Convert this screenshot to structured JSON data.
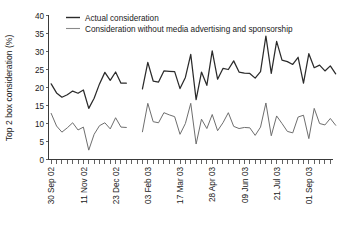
{
  "chart_data": {
    "type": "line",
    "title": "",
    "xlabel": "",
    "ylabel": "Top 2 box consideration (%)",
    "ylim": [
      0,
      40
    ],
    "yticks": [
      0,
      5,
      10,
      15,
      20,
      25,
      30,
      35,
      40
    ],
    "ytick_labels": [
      "0",
      "5",
      "10",
      "15",
      "20",
      "25",
      "30",
      "35",
      "40"
    ],
    "grid": false,
    "legend_position": "top-center",
    "xtick_labels": [
      "30 Sep 02",
      "11 Nov 02",
      "23 Dec 02",
      "03 Feb 03",
      "17 Mar 03",
      "28 Apr 03",
      "09 Jun 03",
      "21 Jul 03",
      "01 Sep 03"
    ],
    "xtick_indices": [
      0,
      6,
      12,
      18,
      24,
      30,
      36,
      42,
      48
    ],
    "n_minor_ticks": 53,
    "gap_note": "Data break between 23 Dec 02 and early Jan 03 (no observations collected)",
    "series": [
      {
        "name": "Actual consideration",
        "color": "#2b2b2b",
        "segments": [
          {
            "x": [
              0,
              1,
              2,
              3,
              4,
              5,
              6,
              7,
              8,
              9,
              10,
              11,
              12,
              13,
              14
            ],
            "values": [
              21.0,
              18.5,
              17.3,
              18.0,
              19.0,
              18.4,
              19.3,
              14.2,
              17.0,
              21.0,
              24.2,
              22.0,
              24.3,
              21.2,
              21.2
            ]
          },
          {
            "x": [
              17,
              18,
              19,
              20,
              21,
              22,
              23,
              24,
              25,
              26,
              27,
              28,
              29,
              30,
              31,
              32,
              33,
              34,
              35,
              36,
              37,
              38,
              39,
              40,
              41,
              42,
              43,
              44,
              45,
              46,
              47,
              48,
              49,
              50,
              51,
              52,
              53
            ],
            "values": [
              19.6,
              27.0,
              21.8,
              21.5,
              24.6,
              24.5,
              24.4,
              19.7,
              22.8,
              29.2,
              16.6,
              24.3,
              20.6,
              30.2,
              22.3,
              25.3,
              25.0,
              27.4,
              24.3,
              24.0,
              23.9,
              22.6,
              24.4,
              34.3,
              23.9,
              32.8,
              27.6,
              27.2,
              26.4,
              28.4,
              21.2,
              29.4,
              25.5,
              26.2,
              24.6,
              26.0,
              23.8
            ]
          }
        ]
      },
      {
        "name": "Consideration without media advertising and sponsorship",
        "color": "#6e6e6e",
        "segments": [
          {
            "x": [
              0,
              1,
              2,
              3,
              4,
              5,
              6,
              7,
              8,
              9,
              10,
              11,
              12,
              13,
              14
            ],
            "values": [
              12.8,
              9.3,
              7.6,
              8.8,
              10.2,
              8.2,
              9.0,
              2.6,
              7.0,
              9.4,
              10.2,
              8.5,
              11.6,
              9.0,
              8.9
            ]
          },
          {
            "x": [
              17,
              18,
              19,
              20,
              21,
              22,
              23,
              24,
              25,
              26,
              27,
              28,
              29,
              30,
              31,
              32,
              33,
              34,
              35,
              36,
              37,
              38,
              39,
              40,
              41,
              42,
              43,
              44,
              45,
              46,
              47,
              48,
              49,
              50,
              51,
              52,
              53
            ],
            "values": [
              7.7,
              15.6,
              10.5,
              10.2,
              13.0,
              12.4,
              11.9,
              7.0,
              10.0,
              15.6,
              4.3,
              11.2,
              8.6,
              12.5,
              8.0,
              10.2,
              13.0,
              9.2,
              8.6,
              8.9,
              8.8,
              6.7,
              9.0,
              15.7,
              6.6,
              12.1,
              10.0,
              7.8,
              7.4,
              11.8,
              12.3,
              5.8,
              14.2,
              10.0,
              9.6,
              11.4,
              9.5
            ]
          }
        ]
      }
    ]
  }
}
